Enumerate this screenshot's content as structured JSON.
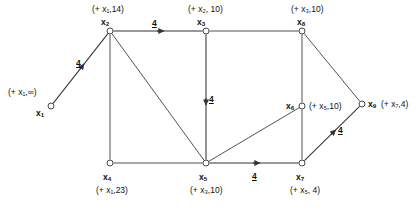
{
  "figure": {
    "kind": "directed-graph-shortest-path-labeling",
    "width": 420,
    "height": 218,
    "stroke_color": "#333333",
    "text_color": "#111111",
    "background": "#ffffff"
  },
  "nodes": [
    {
      "id": "x1",
      "name": "x",
      "sub": "1",
      "x": 51,
      "y": 106,
      "label": "(+ x₁,∞)",
      "label_x": 8,
      "label_y": 88,
      "name_x": 36,
      "name_y": 109
    },
    {
      "id": "x2",
      "name": "x",
      "sub": "2",
      "x": 110,
      "y": 31,
      "label": "(+ x₁,14)",
      "label_x": 92,
      "label_y": 5,
      "name_x": 101,
      "name_y": 18
    },
    {
      "id": "x3",
      "name": "x",
      "sub": "3",
      "x": 206,
      "y": 31,
      "label": "(+ x₂, 10)",
      "label_x": 188,
      "label_y": 5,
      "name_x": 197,
      "name_y": 18
    },
    {
      "id": "x8",
      "name": "x",
      "sub": "8",
      "x": 302,
      "y": 31,
      "label": "(+ x₃,10)",
      "label_x": 291,
      "label_y": 5,
      "name_x": 297,
      "name_y": 18
    },
    {
      "id": "x4",
      "name": "x",
      "sub": "4",
      "x": 110,
      "y": 163,
      "label": "(+ x₁,23)",
      "label_x": 96,
      "label_y": 186,
      "name_x": 103,
      "name_y": 173
    },
    {
      "id": "x5",
      "name": "x",
      "sub": "5",
      "x": 206,
      "y": 163,
      "label": "(+ x₃,10)",
      "label_x": 190,
      "label_y": 186,
      "name_x": 199,
      "name_y": 173
    },
    {
      "id": "x7",
      "name": "x",
      "sub": "7",
      "x": 302,
      "y": 163,
      "label": "(+ x₅, 4)",
      "label_x": 290,
      "label_y": 186,
      "name_x": 296,
      "name_y": 173
    },
    {
      "id": "x6",
      "name": "x",
      "sub": "6",
      "x": 302,
      "y": 106,
      "label": "(+ x₅,10)",
      "label_x": 309,
      "label_y": 102,
      "name_x": 286,
      "name_y": 102
    },
    {
      "id": "x9",
      "name": "x",
      "sub": "9",
      "x": 362,
      "y": 104,
      "label": "(+ x₇,4)",
      "label_x": 381,
      "label_y": 100,
      "name_x": 368,
      "name_y": 100
    }
  ],
  "edges": [
    {
      "from": "x1",
      "to": "x2",
      "directed": true,
      "weight": "4",
      "weight_x": 76,
      "weight_y": 59
    },
    {
      "from": "x2",
      "to": "x3",
      "directed": true,
      "weight": "4",
      "weight_x": 152,
      "weight_y": 19
    },
    {
      "from": "x3",
      "to": "x5",
      "directed": true,
      "weight": "4",
      "weight_x": 209,
      "weight_y": 95
    },
    {
      "from": "x5",
      "to": "x7",
      "directed": true,
      "weight": "4",
      "weight_x": 252,
      "weight_y": 172
    },
    {
      "from": "x7",
      "to": "x9",
      "directed": true,
      "weight": "4",
      "weight_x": 338,
      "weight_y": 126
    },
    {
      "from": "x2",
      "to": "x4",
      "directed": false,
      "weight": "",
      "weight_x": 0,
      "weight_y": 0
    },
    {
      "from": "x2",
      "to": "x5",
      "directed": false,
      "weight": "",
      "weight_x": 0,
      "weight_y": 0
    },
    {
      "from": "x3",
      "to": "x8",
      "directed": false,
      "weight": "",
      "weight_x": 0,
      "weight_y": 0
    },
    {
      "from": "x4",
      "to": "x5",
      "directed": false,
      "weight": "",
      "weight_x": 0,
      "weight_y": 0
    },
    {
      "from": "x8",
      "to": "x6",
      "directed": false,
      "weight": "",
      "weight_x": 0,
      "weight_y": 0
    },
    {
      "from": "x8",
      "to": "x9",
      "directed": false,
      "weight": "",
      "weight_x": 0,
      "weight_y": 0
    },
    {
      "from": "x6",
      "to": "x7",
      "directed": false,
      "weight": "",
      "weight_x": 0,
      "weight_y": 0
    },
    {
      "from": "x5",
      "to": "x6",
      "directed": false,
      "weight": "",
      "weight_x": 0,
      "weight_y": 0
    }
  ]
}
